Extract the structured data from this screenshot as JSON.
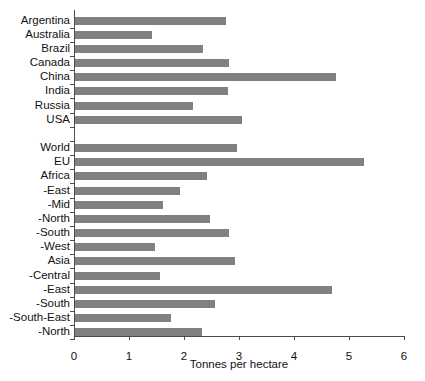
{
  "chart_data": {
    "type": "bar",
    "orientation": "horizontal",
    "title": "",
    "xlabel": "Tonnes per hectare",
    "ylabel": "",
    "xlim": [
      0,
      6
    ],
    "xticks": [
      0,
      1,
      2,
      3,
      4,
      5,
      6
    ],
    "grid": false,
    "legend": null,
    "bar_color": "#808080",
    "axis_color": "#4d4d4d",
    "categories": [
      "Argentina",
      "Australia",
      "Brazil",
      "Canada",
      "China",
      "India",
      "Russia",
      "USA",
      "",
      "World",
      "EU",
      "Africa",
      "-East",
      "-Mid",
      "-North",
      "-South",
      "-West",
      "Asia",
      "-Central",
      "-East",
      "-South",
      "-South-East",
      "-North"
    ],
    "values": [
      2.75,
      1.4,
      2.32,
      2.8,
      4.74,
      2.79,
      2.15,
      3.04,
      null,
      2.95,
      5.25,
      2.4,
      1.9,
      1.6,
      2.45,
      2.8,
      1.45,
      2.9,
      1.55,
      4.67,
      2.55,
      1.75,
      2.3
    ]
  }
}
